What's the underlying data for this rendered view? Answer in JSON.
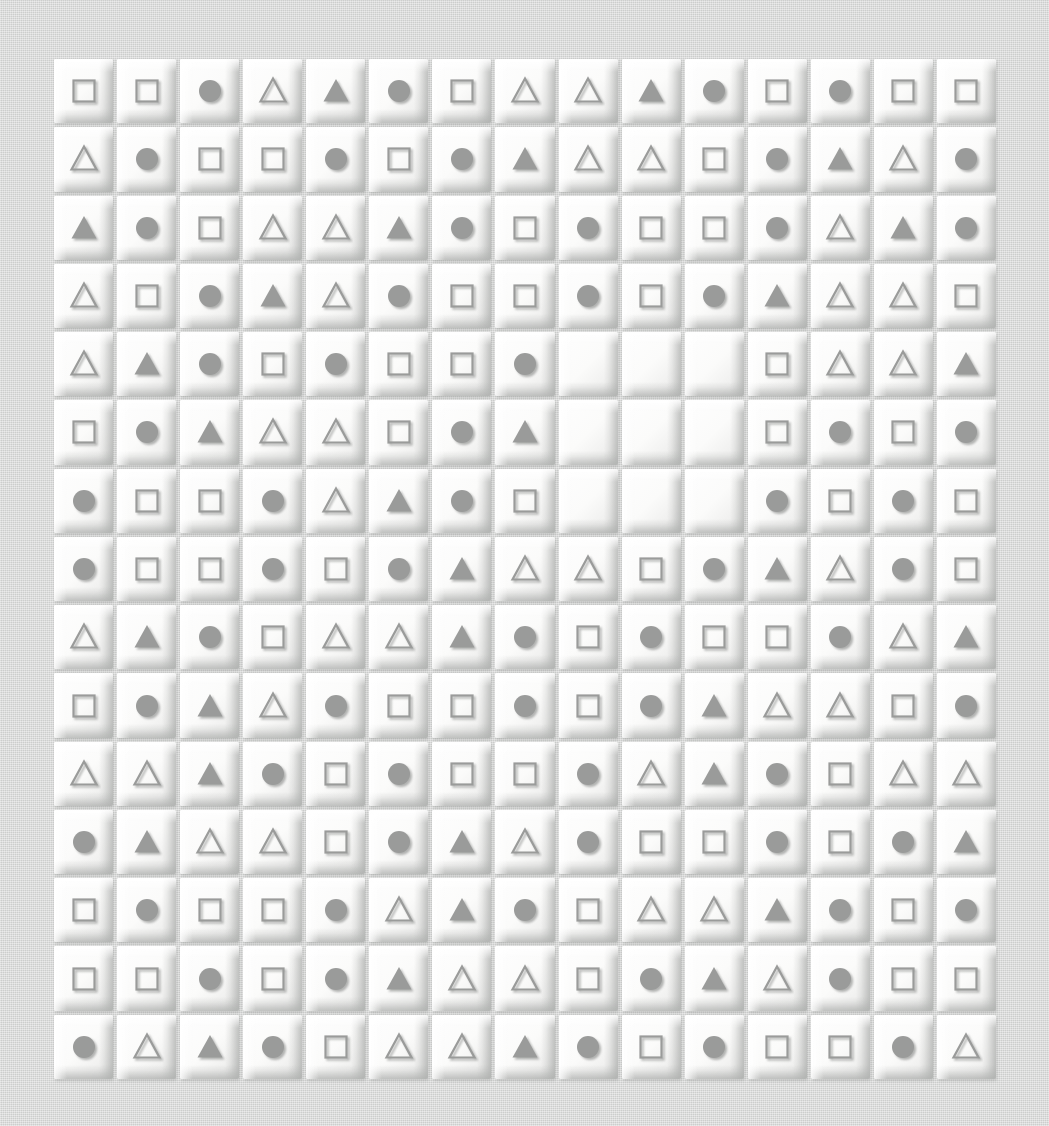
{
  "canvas": {
    "width": 1049,
    "height": 1126,
    "background_color": "#d6d7d6",
    "surface_description": "woven fabric texture"
  },
  "grid": {
    "name": "embossed-shape-tile-grid",
    "rows": 15,
    "columns": 15,
    "total_cells": 225,
    "empty_cells": 9,
    "filled_cells": 216,
    "tile_face_color": "#fbfbfa",
    "tile_highlight_color": "#ffffff",
    "tile_shadow_color": "#b0b2b0",
    "shape_color": "#9a9b9a",
    "shape_outline_color": "#9a9b9a",
    "empty_block": {
      "row_start": 5,
      "row_end": 7,
      "column_start": 9,
      "column_end": 11
    },
    "legend": {
      "sq": "square-outline",
      "ci": "circle-filled",
      "to": "triangle-outline",
      "tf": "triangle-filled",
      "em": "empty-tile"
    },
    "cells": [
      [
        "sq",
        "sq",
        "ci",
        "to",
        "tf",
        "ci",
        "sq",
        "to",
        "to",
        "tf",
        "ci",
        "sq",
        "ci",
        "sq",
        "sq"
      ],
      [
        "to",
        "ci",
        "sq",
        "sq",
        "ci",
        "sq",
        "ci",
        "tf",
        "to",
        "to",
        "sq",
        "ci",
        "tf",
        "to",
        "ci"
      ],
      [
        "tf",
        "ci",
        "sq",
        "to",
        "to",
        "tf",
        "ci",
        "sq",
        "ci",
        "sq",
        "sq",
        "ci",
        "to",
        "tf",
        "ci"
      ],
      [
        "to",
        "sq",
        "ci",
        "tf",
        "to",
        "ci",
        "sq",
        "sq",
        "ci",
        "sq",
        "ci",
        "tf",
        "to",
        "to",
        "sq"
      ],
      [
        "to",
        "tf",
        "ci",
        "sq",
        "ci",
        "sq",
        "sq",
        "ci",
        "em",
        "em",
        "em",
        "sq",
        "to",
        "to",
        "tf"
      ],
      [
        "sq",
        "ci",
        "tf",
        "to",
        "to",
        "sq",
        "ci",
        "tf",
        "em",
        "em",
        "em",
        "sq",
        "ci",
        "sq",
        "ci"
      ],
      [
        "ci",
        "sq",
        "sq",
        "ci",
        "to",
        "tf",
        "ci",
        "sq",
        "em",
        "em",
        "em",
        "ci",
        "sq",
        "ci",
        "sq"
      ],
      [
        "ci",
        "sq",
        "sq",
        "ci",
        "sq",
        "ci",
        "tf",
        "to",
        "to",
        "sq",
        "ci",
        "tf",
        "to",
        "ci",
        "sq"
      ],
      [
        "to",
        "tf",
        "ci",
        "sq",
        "to",
        "to",
        "tf",
        "ci",
        "sq",
        "ci",
        "sq",
        "sq",
        "ci",
        "to",
        "tf"
      ],
      [
        "sq",
        "ci",
        "tf",
        "to",
        "ci",
        "sq",
        "sq",
        "ci",
        "sq",
        "ci",
        "tf",
        "to",
        "to",
        "sq",
        "ci"
      ],
      [
        "to",
        "to",
        "tf",
        "ci",
        "sq",
        "ci",
        "sq",
        "sq",
        "ci",
        "to",
        "tf",
        "ci",
        "sq",
        "to",
        "to"
      ],
      [
        "ci",
        "tf",
        "to",
        "to",
        "sq",
        "ci",
        "tf",
        "to",
        "ci",
        "sq",
        "sq",
        "ci",
        "sq",
        "ci",
        "tf"
      ],
      [
        "sq",
        "ci",
        "sq",
        "sq",
        "ci",
        "to",
        "tf",
        "ci",
        "sq",
        "to",
        "to",
        "tf",
        "ci",
        "sq",
        "ci"
      ],
      [
        "sq",
        "sq",
        "ci",
        "sq",
        "ci",
        "tf",
        "to",
        "to",
        "sq",
        "ci",
        "tf",
        "to",
        "ci",
        "sq",
        "sq"
      ],
      [
        "ci",
        "to",
        "tf",
        "ci",
        "sq",
        "to",
        "to",
        "tf",
        "ci",
        "sq",
        "ci",
        "sq",
        "sq",
        "ci",
        "to"
      ]
    ]
  }
}
